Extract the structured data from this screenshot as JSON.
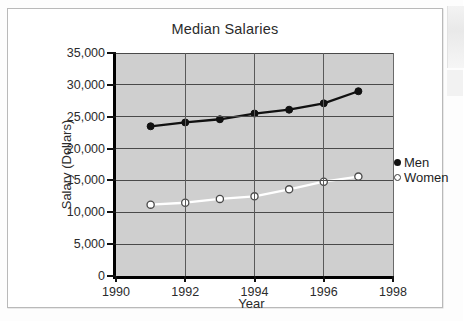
{
  "chart_data": {
    "type": "line",
    "title": "Median Salaries",
    "xlabel": "Year",
    "ylabel": "Salary (Dollars)",
    "x": [
      1991,
      1992,
      1993,
      1994,
      1995,
      1996,
      1997
    ],
    "xlim": [
      1990,
      1998
    ],
    "ylim": [
      0,
      35000
    ],
    "xticks": [
      1990,
      1992,
      1994,
      1996,
      1998
    ],
    "xticklabels": [
      "1990",
      "1992",
      "1994",
      "1996",
      "1998"
    ],
    "yticks": [
      0,
      5000,
      10000,
      15000,
      20000,
      25000,
      30000,
      35000
    ],
    "yticklabels": [
      "0",
      "5,000",
      "10,000",
      "15,000",
      "20,000",
      "25,000",
      "30,000",
      "35,000"
    ],
    "grid": true,
    "legend_position": "right",
    "plot_background": "#cfcfcf",
    "series": [
      {
        "name": "Men",
        "marker": "filled-circle",
        "color": "#111111",
        "values": [
          23500,
          24100,
          24600,
          25500,
          26100,
          27100,
          29000
        ]
      },
      {
        "name": "Women",
        "marker": "open-circle",
        "color": "#ffffff",
        "values": [
          11200,
          11500,
          12100,
          12500,
          13600,
          14800,
          15600
        ]
      }
    ]
  },
  "legend": {
    "items": [
      {
        "label": "Men",
        "marker": "filled-circle"
      },
      {
        "label": "Women",
        "marker": "open-circle"
      }
    ]
  }
}
